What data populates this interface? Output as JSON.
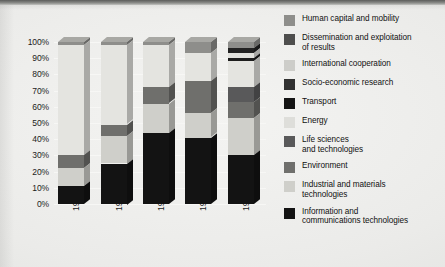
{
  "chart_data": {
    "type": "bar",
    "subtype": "stacked-percentage-3d",
    "title": "",
    "xlabel": "",
    "ylabel": "",
    "ylim": [
      0,
      100
    ],
    "ytick_labels": [
      "100%",
      "90%",
      "80%",
      "70%",
      "60%",
      "50%",
      "40%",
      "30%",
      "20%",
      "10%",
      "0%"
    ],
    "ytick_values": [
      100,
      90,
      80,
      70,
      60,
      50,
      40,
      30,
      20,
      10,
      0
    ],
    "grid": true,
    "legend_position": "right",
    "categories": [
      "1982",
      "1984-1987",
      "1987-1991",
      "1990-1994",
      "1994-1998"
    ],
    "series": [
      {
        "name": "Information and communications technologies",
        "color": "#131313",
        "values": [
          11,
          25,
          44,
          41,
          30
        ]
      },
      {
        "name": "Industrial and materials technologies",
        "color": "#cfcfca",
        "values": [
          11,
          17,
          18,
          15,
          23
        ]
      },
      {
        "name": "Environment",
        "color": "#6f6f6c",
        "values": [
          8,
          7,
          10,
          20,
          10
        ]
      },
      {
        "name": "Life sciences and technologies",
        "color": "#59595a",
        "values": [
          0,
          0,
          0,
          0,
          9
        ]
      },
      {
        "name": "Energy",
        "color": "#e4e4e0",
        "values": [
          68,
          49,
          26,
          17,
          16
        ]
      },
      {
        "name": "Transport",
        "color": "#1d1d1d",
        "values": [
          0,
          0,
          0,
          0,
          2
        ]
      },
      {
        "name": "Socio-economic research",
        "color": "#e1e1dd",
        "values": [
          0,
          0,
          0,
          0,
          3
        ]
      },
      {
        "name": "International cooperation",
        "color": "#222222",
        "values": [
          0,
          0,
          0,
          0,
          3
        ]
      },
      {
        "name": "Human capital and mobility",
        "color": "#8e8e8b",
        "values": [
          2,
          2,
          2,
          7,
          4
        ]
      }
    ]
  },
  "legend": {
    "items": [
      {
        "label": "Human capital and mobility",
        "color": "#8e8e8b",
        "icon": "legend-swatch-icon"
      },
      {
        "label": "Dissemination and exploitation\nof results",
        "color": "#4e4e4d",
        "icon": "legend-swatch-icon"
      },
      {
        "label": "International cooperation",
        "color": "#cdcdc9",
        "icon": "legend-swatch-icon"
      },
      {
        "label": "Socio-economic research",
        "color": "#313131",
        "icon": "legend-swatch-icon"
      },
      {
        "label": "Transport",
        "color": "#141414",
        "icon": "legend-swatch-icon"
      },
      {
        "label": "Energy",
        "color": "#dedeDa",
        "icon": "legend-swatch-icon"
      },
      {
        "label": "Life sciences\nand technologies",
        "color": "#59595a",
        "icon": "legend-swatch-icon"
      },
      {
        "label": "Environment",
        "color": "#6f6f6c",
        "icon": "legend-swatch-icon"
      },
      {
        "label": "Industrial and materials\ntechnologies",
        "color": "#cfcfca",
        "icon": "legend-swatch-icon"
      },
      {
        "label": "Information and\ncommunications technologies",
        "color": "#131313",
        "icon": "legend-swatch-icon"
      }
    ]
  },
  "bars": [
    {
      "category": "1982",
      "segments": [
        {
          "name": "Information and communications technologies",
          "from": 0,
          "to": 11,
          "color": "#131313"
        },
        {
          "name": "Industrial and materials technologies",
          "from": 11,
          "to": 22,
          "color": "#cfcfca"
        },
        {
          "name": "Environment",
          "from": 22,
          "to": 30,
          "color": "#6f6f6c"
        },
        {
          "name": "Energy",
          "from": 30,
          "to": 98,
          "color": "#e4e4e0"
        },
        {
          "name": "Human capital and mobility",
          "from": 98,
          "to": 100,
          "color": "#8e8e8b"
        }
      ]
    },
    {
      "category": "1984-1987",
      "segments": [
        {
          "name": "Information and communications technologies",
          "from": 0,
          "to": 25,
          "color": "#131313"
        },
        {
          "name": "Industrial and materials technologies",
          "from": 25,
          "to": 42,
          "color": "#cfcfca"
        },
        {
          "name": "Environment",
          "from": 42,
          "to": 49,
          "color": "#6f6f6c"
        },
        {
          "name": "Energy",
          "from": 49,
          "to": 98,
          "color": "#e4e4e0"
        },
        {
          "name": "Human capital and mobility",
          "from": 98,
          "to": 100,
          "color": "#8e8e8b"
        }
      ]
    },
    {
      "category": "1987-1991",
      "segments": [
        {
          "name": "Information and communications technologies",
          "from": 0,
          "to": 44,
          "color": "#131313"
        },
        {
          "name": "Industrial and materials technologies",
          "from": 44,
          "to": 62,
          "color": "#cfcfca"
        },
        {
          "name": "Environment",
          "from": 62,
          "to": 72,
          "color": "#6f6f6c"
        },
        {
          "name": "Energy",
          "from": 72,
          "to": 98,
          "color": "#e4e4e0"
        },
        {
          "name": "Human capital and mobility",
          "from": 98,
          "to": 100,
          "color": "#8e8e8b"
        }
      ]
    },
    {
      "category": "1990-1994",
      "segments": [
        {
          "name": "Information and communications technologies",
          "from": 0,
          "to": 41,
          "color": "#131313"
        },
        {
          "name": "Industrial and materials technologies",
          "from": 41,
          "to": 56,
          "color": "#cfcfca"
        },
        {
          "name": "Environment",
          "from": 56,
          "to": 76,
          "color": "#6f6f6c"
        },
        {
          "name": "Energy",
          "from": 76,
          "to": 93,
          "color": "#e4e4e0"
        },
        {
          "name": "Human capital and mobility",
          "from": 93,
          "to": 100,
          "color": "#8e8e8b"
        }
      ]
    },
    {
      "category": "1994-1998",
      "segments": [
        {
          "name": "Information and communications technologies",
          "from": 0,
          "to": 30,
          "color": "#131313"
        },
        {
          "name": "Industrial and materials technologies",
          "from": 30,
          "to": 53,
          "color": "#cfcfca"
        },
        {
          "name": "Environment",
          "from": 53,
          "to": 63,
          "color": "#6f6f6c"
        },
        {
          "name": "Life sciences and technologies",
          "from": 63,
          "to": 72,
          "color": "#59595a"
        },
        {
          "name": "Energy",
          "from": 72,
          "to": 88,
          "color": "#e4e4e0"
        },
        {
          "name": "Transport",
          "from": 88,
          "to": 90,
          "color": "#1d1d1d"
        },
        {
          "name": "Socio-economic research",
          "from": 90,
          "to": 93,
          "color": "#e1e1dd"
        },
        {
          "name": "International cooperation",
          "from": 93,
          "to": 96,
          "color": "#222222"
        },
        {
          "name": "Human capital and mobility",
          "from": 96,
          "to": 100,
          "color": "#8e8e8b"
        }
      ]
    }
  ]
}
